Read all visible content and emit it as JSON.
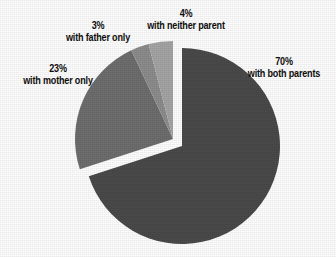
{
  "chart_data": {
    "type": "pie",
    "title": "",
    "subtitle": "",
    "xlabel": "",
    "ylabel": "",
    "legend_position": "callout-labels",
    "grid": false,
    "units": "percent",
    "categories": [
      "with both parents",
      "with mother only",
      "with father only",
      "with neither parent"
    ],
    "values": [
      70,
      23,
      3,
      4
    ],
    "labels": [
      "70%",
      "23%",
      "3%",
      "4%"
    ],
    "colors": [
      "#4a4a4a",
      "#6e6e6e",
      "#8d8d8d",
      "#a5a5a5"
    ],
    "start_angle_deg": 0,
    "direction": "clockwise",
    "exploded_slices": [
      "with mother only",
      "with father only",
      "with neither parent"
    ],
    "slices": [
      {
        "label": "70%",
        "description": "with both parents",
        "value": 70,
        "color": "#4a4a4a",
        "exploded": false
      },
      {
        "label": "23%",
        "description": "with mother only",
        "value": 23,
        "color": "#6e6e6e",
        "exploded": true
      },
      {
        "label": "3%",
        "description": "with father only",
        "value": 3,
        "color": "#8d8d8d",
        "exploded": true
      },
      {
        "label": "4%",
        "description": "with neither parent",
        "value": 4,
        "color": "#a5a5a5",
        "exploded": true
      }
    ]
  },
  "callouts": {
    "both": {
      "pct": "70%",
      "desc": "with both parents"
    },
    "mother": {
      "pct": "23%",
      "desc": "with mother only"
    },
    "father": {
      "pct": "3%",
      "desc": "with father only"
    },
    "neither": {
      "pct": "4%",
      "desc": "with neither parent"
    }
  },
  "style": {
    "background": "#ffffff",
    "text_color": "#0d0d0d"
  }
}
